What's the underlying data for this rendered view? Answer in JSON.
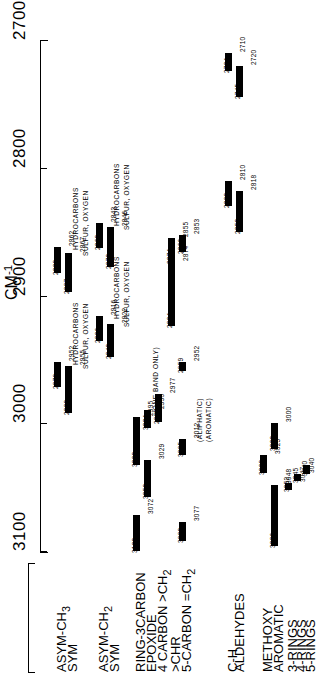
{
  "chart_data": {
    "type": "bar",
    "xlabel": "CM-1",
    "ylabel": "",
    "axis": {
      "unit_label": "CM",
      "unit_exponent": "-1",
      "ticks": [
        2700,
        2800,
        2900,
        3000,
        3100
      ],
      "range": [
        2700,
        3100
      ],
      "orientation": "vertical-rotated",
      "grid": false
    },
    "annotations": [
      {
        "text": "HYDROCARBONS",
        "near": 2952
      },
      {
        "text": "SULFUR, OXYGEN",
        "near": 2955
      },
      {
        "text": "HYDROCARBONS",
        "near": 2862
      },
      {
        "text": "SULFUR, OXYGEN",
        "near": 2867
      },
      {
        "text": "HYDROCARBONS",
        "near": 2916
      },
      {
        "text": "SULFUR, OXYGEN",
        "near": 2922
      },
      {
        "text": "HYDROCARBONS",
        "near": 2843
      },
      {
        "text": "SULFUR, OXYGEN",
        "near": 2846
      },
      {
        "text": "(ONE BAND ONLY)",
        "near": 2990
      },
      {
        "text": "(ALIPHATIC)",
        "near": 3012
      },
      {
        "text": "(AROMATIC)",
        "near": 3012
      }
    ],
    "rows": [
      {
        "name": "ASYM-CH3",
        "label_html": "ASYM-CH<sub>3</sub>",
        "x": 54,
        "bars": [
          {
            "from": 2972,
            "to": 2952,
            "low_label": "2972",
            "high_label": "2952"
          },
          {
            "from": 2882,
            "to": 2862,
            "low_label": "2882",
            "high_label": "2862"
          }
        ]
      },
      {
        "name": "SYM",
        "label_html": "SYM",
        "x": 65,
        "bars": [
          {
            "from": 2992,
            "to": 2955,
            "low_label": "2992",
            "high_label": "2955"
          },
          {
            "from": 2897,
            "to": 2867,
            "low_label": "2897",
            "high_label": "2867"
          }
        ]
      },
      {
        "name": "ASYM-CH2",
        "label_html": "ASYM-CH<sub>2</sub>",
        "x": 96,
        "bars": [
          {
            "from": 2936,
            "to": 2916,
            "low_label": "2936",
            "high_label": "2916"
          },
          {
            "from": 2863,
            "to": 2843,
            "low_label": "2863",
            "high_label": "2843"
          }
        ]
      },
      {
        "name": "SYM",
        "label_html": "SYM",
        "x": 107,
        "bars": [
          {
            "from": 2948,
            "to": 2922,
            "low_label": "2948",
            "high_label": "2922"
          },
          {
            "from": 2878,
            "to": 2846,
            "low_label": "2878",
            "high_label": "2846"
          }
        ]
      },
      {
        "name": "RING-3CARBON",
        "label_html": "RING-3CARBON",
        "x": 133,
        "bars": [
          {
            "from": 3100,
            "to": 3072,
            "low_label": "3100",
            "high_label": "3072"
          },
          {
            "from": 3033,
            "to": 2995,
            "low_label": "3033",
            "high_label": "2995"
          }
        ]
      },
      {
        "name": "EPOXIDE",
        "label_html": "EPOXIDE",
        "x": 144,
        "bars": [
          {
            "from": 3058,
            "to": 3029,
            "low_label": "3058",
            "high_label": "3029"
          },
          {
            "from": 3004,
            "to": 2990,
            "low_label": "3004",
            "high_label": "2990"
          }
        ]
      },
      {
        "name": "4CARBON-CH2",
        "label_html": "4 CARBON &gt;CH<sub>2</sub>",
        "x": 155,
        "bars": [
          {
            "from": 2999,
            "to": 2977,
            "low_label": "2999",
            "high_label": "2977"
          }
        ]
      },
      {
        "name": "CHR",
        "label_html": "&gt;CHR",
        "x": 168,
        "bars": [
          {
            "from": 2924,
            "to": 2874,
            "low_label": "2924",
            "high_label": "2874"
          },
          {
            "from": 2874,
            "to": 2855,
            "low_label": "2874",
            "high_label": "2855"
          }
        ]
      },
      {
        "name": "5-CARBON-CH2",
        "label_html": "5-CARBON =CH<sub>2</sub>",
        "x": 179,
        "bars": [
          {
            "from": 3092,
            "to": 3077,
            "low_label": "3092",
            "high_label": "3077"
          },
          {
            "from": 3025,
            "to": 3012,
            "low_label": "3025",
            "high_label": "3012"
          },
          {
            "from": 2959,
            "to": 2952,
            "low_label": "2959",
            "high_label": "2952"
          },
          {
            "from": 2866,
            "to": 2853,
            "low_label": "2866",
            "high_label": "2853"
          }
        ]
      },
      {
        "name": "ALDEHYDES-CH-ALIPHATIC",
        "label_html": "C-H",
        "x": 225,
        "bars": [
          {
            "from": 2830,
            "to": 2810,
            "low_label": "2830",
            "high_label": "2810"
          },
          {
            "from": 2724,
            "to": 2710,
            "low_label": "2724",
            "high_label": "2710"
          }
        ]
      },
      {
        "name": "ALDEHYDES-CH-AROMATIC",
        "label_html": "",
        "x": 236,
        "bars": [
          {
            "from": 2850,
            "to": 2818,
            "low_label": "2850",
            "high_label": "2818"
          },
          {
            "from": 2745,
            "to": 2720,
            "low_label": "2745",
            "high_label": "2720"
          }
        ]
      },
      {
        "name": "METHOXY",
        "label_html": "METHOXY",
        "x": 260,
        "bars": [
          {
            "from": 3039,
            "to": 3025,
            "low_label": "3039",
            "high_label": "3025"
          }
        ]
      },
      {
        "name": "AROMATIC",
        "label_html": "AROMATIC",
        "x": 271,
        "bars": [
          {
            "from": 3096,
            "to": 3048,
            "low_label": "3096",
            "high_label": "3048"
          },
          {
            "from": 3020,
            "to": 3000,
            "low_label": "3020",
            "high_label": "3000"
          }
        ]
      },
      {
        "name": "3-RINGS",
        "label_html": "3-RINGS",
        "x": 285,
        "bars": [
          {
            "from": 3052,
            "to": 3047,
            "low_label": "3052",
            "high_label": "3047"
          }
        ]
      },
      {
        "name": "4-RINGS",
        "label_html": "4-RINGS",
        "x": 294,
        "bars": [
          {
            "from": 3045,
            "to": 3040,
            "low_label": "3045",
            "high_label": "3040"
          }
        ]
      },
      {
        "name": "5-RINGS",
        "label_html": "5-RINGS",
        "x": 303,
        "bars": [
          {
            "from": 3040,
            "to": 3033,
            "low_label": "3040",
            "high_label": "3033"
          }
        ]
      }
    ],
    "group_labels": [
      {
        "text": "ALDEHYDES",
        "rows": [
          "ALDEHYDES-CH-ALIPHATIC",
          "ALDEHYDES-CH-AROMATIC"
        ]
      }
    ]
  }
}
